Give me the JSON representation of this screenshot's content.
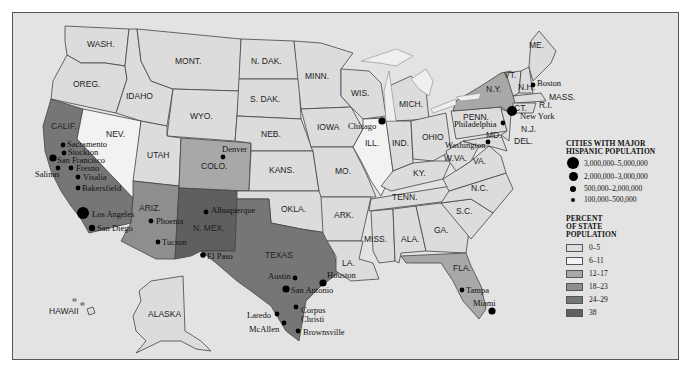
{
  "colors": {
    "bg": "#e3e3e3",
    "p0_5": "#dcdcdc",
    "p6_11": "#f2f2f2",
    "p12_17": "#a8a8a8",
    "p18_23": "#8e8e8e",
    "p24_29": "#767676",
    "p38": "#5f5f5f",
    "lakes": "#efefef"
  },
  "states": {
    "wash": "WASH.",
    "oreg": "OREG.",
    "calif": "CALIF.",
    "idaho": "IDAHO",
    "nev": "NEV.",
    "mont": "MONT.",
    "wyo": "WYO.",
    "utah": "UTAH",
    "ariz": "ARIZ.",
    "colo": "COLO.",
    "nmex": "N. MEX.",
    "ndak": "N. DAK.",
    "sdak": "S. DAK.",
    "neb": "NEB.",
    "kans": "KANS.",
    "okla": "OKLA.",
    "texas": "TEXAS",
    "minn": "MINN.",
    "iowa": "IOWA",
    "mo": "MO.",
    "ark": "ARK.",
    "la": "LA.",
    "wis": "WIS.",
    "ill": "ILL.",
    "mich": "MICH.",
    "ind": "IND.",
    "ohio": "OHIO",
    "ky": "KY.",
    "tenn": "TENN.",
    "miss": "MISS.",
    "ala": "ALA.",
    "ga": "GA.",
    "fla": "FLA.",
    "sc": "S.C.",
    "nc": "N.C.",
    "va": "VA.",
    "wva": "W.VA.",
    "penn": "PENN.",
    "ny": "N.Y.",
    "vt": "VT.",
    "nh": "N.H.",
    "me": "ME.",
    "mass": "MASS.",
    "ri": "R.I.",
    "ct": "CT.",
    "nj": "N.J.",
    "del": "DEL.",
    "md": "MD.",
    "alaska": "ALASKA",
    "hawaii": "HAWAII"
  },
  "cities": {
    "sacramento": "Sacramento",
    "stockton": "Stockton",
    "san_francisco": "San Francisco",
    "salinas": "Salinas",
    "fresno": "Fresno",
    "visalia": "Visalia",
    "bakersfield": "Bakersfield",
    "los_angeles": "Los Angeles",
    "san_diego": "San Diego",
    "phoenix": "Phoenix",
    "tucson": "Tucson",
    "albuquerque": "Albuquerque",
    "el_paso": "El Paso",
    "denver": "Denver",
    "chicago": "Chicago",
    "austin": "Austin",
    "san_antonio": "San Antonio",
    "houston": "Houston",
    "corpus": "Corpus",
    "christi": "Christi",
    "laredo": "Laredo",
    "mcallen": "McAllen",
    "brownsville": "Brownsville",
    "new_york": "New York",
    "philadelphia": "Philadelphia",
    "washington": "Washington",
    "boston": "Boston",
    "tampa": "Tampa",
    "miami": "Miami"
  },
  "legend": {
    "cities_title_1": "CITIES WITH MAJOR",
    "cities_title_2": "HISPANIC POPULATION",
    "sizes": [
      {
        "label": "3,000,000–5,000,000",
        "size": 12
      },
      {
        "label": "2,000,000–3,000,000",
        "size": 9
      },
      {
        "label": "500,000–2,000,000",
        "size": 6
      },
      {
        "label": "100,000–500,000",
        "size": 4
      }
    ],
    "percent_title_1": "PERCENT",
    "percent_title_2": "OF STATE",
    "percent_title_3": "POPULATION",
    "ranges": [
      {
        "label": "0–5",
        "color": "#dcdcdc"
      },
      {
        "label": "6–11",
        "color": "#f2f2f2"
      },
      {
        "label": "12–17",
        "color": "#a8a8a8"
      },
      {
        "label": "18–23",
        "color": "#8e8e8e"
      },
      {
        "label": "24–29",
        "color": "#767676"
      },
      {
        "label": "38",
        "color": "#5f5f5f"
      }
    ]
  }
}
